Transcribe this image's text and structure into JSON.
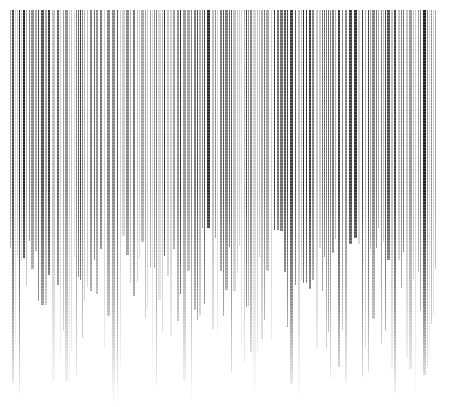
{
  "image": {
    "description": "Abstract field of dense vertical halftone stripes in black and gray that fade out toward the bottom on a white background",
    "colors": {
      "background": "#ffffff",
      "dark_stripe": "#1a1a1a",
      "mid_stripe": "#6e6e6e",
      "light_stripe": "#b5b5b5"
    },
    "stripe_region": {
      "left": 10,
      "top": 10,
      "right": 436,
      "fade_start_y": 190,
      "fade_end_y": 405
    }
  }
}
